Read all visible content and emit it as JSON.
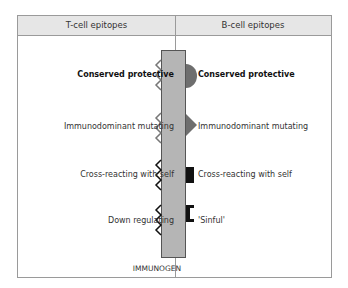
{
  "header": {
    "left_title": "T-cell epitopes",
    "right_title": "B-cell epitopes"
  },
  "t_cell": [
    {
      "label": "Conserved protective",
      "bold": true
    },
    {
      "label": "Immunodominant mutating",
      "bold": false
    },
    {
      "label": "Cross-reacting with self",
      "bold": false
    },
    {
      "label": "Down regulating",
      "bold": false
    }
  ],
  "b_cell": [
    {
      "label": "Conserved protective",
      "bold": true,
      "shape": "semicircle"
    },
    {
      "label": "Immunodominant mutating",
      "bold": false,
      "shape": "triangle"
    },
    {
      "label": "Cross-reacting with self",
      "bold": false,
      "shape": "square"
    },
    {
      "label": "'Sinful'",
      "bold": false,
      "shape": "bracket"
    }
  ],
  "immunogen_label": "IMMUNOGEN",
  "colors": {
    "bar": "#b5b5b5",
    "header": "#e6e6e6",
    "gray_shape": "#6e6e6e",
    "black_shape": "#111111"
  }
}
